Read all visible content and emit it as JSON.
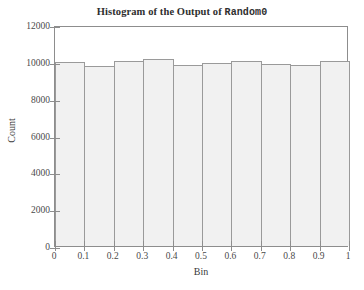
{
  "chart_data": {
    "type": "bar",
    "title": "Histogram of the Output of Random0",
    "title_plain": "Histogram of the Output of ",
    "title_mono": "Random0",
    "xlabel": "Bin",
    "ylabel": "Count",
    "xlim": [
      0,
      1
    ],
    "ylim": [
      0,
      12000
    ],
    "grid": false,
    "legend": false,
    "bar_color": "#f1f1f1",
    "bar_edge_color": "#9a9a9a",
    "axis_color": "#8d8d8d",
    "text_color": "#3a3a3a",
    "categories": [
      "0.0-0.1",
      "0.1-0.2",
      "0.2-0.3",
      "0.3-0.4",
      "0.4-0.5",
      "0.5-0.6",
      "0.6-0.7",
      "0.7-0.8",
      "0.8-0.9",
      "0.9-1.0"
    ],
    "bin_edges": [
      0,
      0.1,
      0.2,
      0.3,
      0.4,
      0.5,
      0.6,
      0.7,
      0.8,
      0.9,
      1
    ],
    "values": [
      10000,
      9790,
      10030,
      10150,
      9840,
      9960,
      10030,
      9900,
      9850,
      10040
    ],
    "xticks": [
      0,
      0.1,
      0.2,
      0.3,
      0.4,
      0.5,
      0.6,
      0.7,
      0.8,
      0.9,
      1
    ],
    "xtick_labels": [
      "0",
      "0.1",
      "0.2",
      "0.3",
      "0.4",
      "0.5",
      "0.6",
      "0.7",
      "0.8",
      "0.9",
      "1"
    ],
    "yticks": [
      0,
      2000,
      4000,
      6000,
      8000,
      10000,
      12000
    ],
    "ytick_labels": [
      "0",
      "2000",
      "4000",
      "6000",
      "8000",
      "10000",
      "12000"
    ]
  }
}
